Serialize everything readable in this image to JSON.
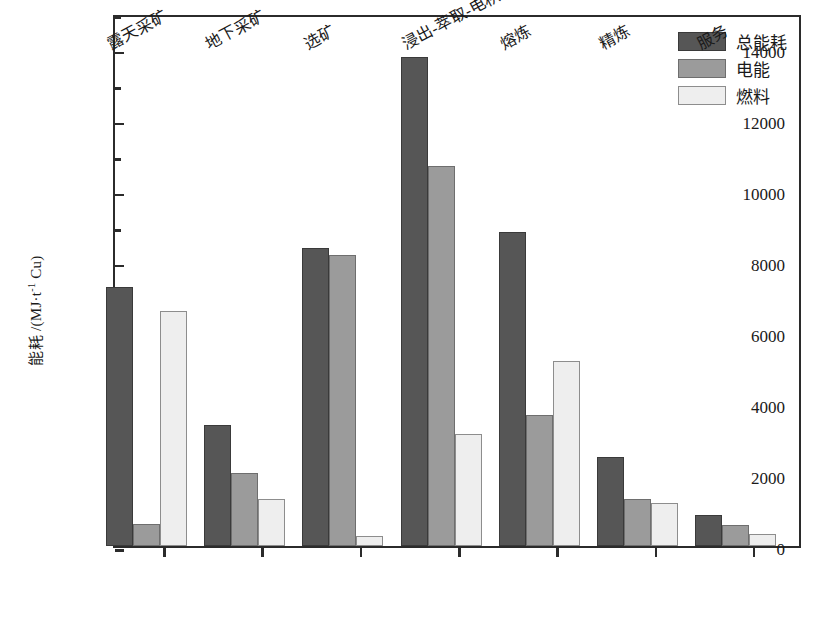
{
  "chart_data": {
    "type": "bar",
    "title": "",
    "xlabel": "",
    "ylabel": "能耗 /(MJ·t⁻¹ Cu)",
    "ylabel_main": "能耗 /(MJ·t",
    "ylabel_sup": "-1",
    "ylabel_tail": " Cu)",
    "ylim": [
      0,
      15000
    ],
    "ytick_labels": [
      "0",
      "2000",
      "4000",
      "6000",
      "8000",
      "10000",
      "12000",
      "14000"
    ],
    "ytick_values": [
      0,
      2000,
      4000,
      6000,
      8000,
      10000,
      12000,
      14000
    ],
    "yminor_values": [
      1000,
      3000,
      5000,
      7000,
      9000,
      11000,
      13000,
      15000
    ],
    "grid": false,
    "legend_position": "top-right",
    "categories": [
      "露天采矿",
      "地下采矿",
      "选矿",
      "浸出-萃取-电积",
      "熔炼",
      "精炼",
      "服务"
    ],
    "series": [
      {
        "name": "总能耗",
        "color": "#565656",
        "values": [
          7300,
          3400,
          8400,
          13750,
          8850,
          2500,
          870
        ]
      },
      {
        "name": "电能",
        "color": "#9b9b9b",
        "values": [
          620,
          2060,
          8200,
          10700,
          3700,
          1320,
          580
        ]
      },
      {
        "name": "燃料",
        "color": "#eeeeee",
        "values": [
          6600,
          1310,
          270,
          3150,
          5200,
          1210,
          330
        ]
      }
    ]
  }
}
